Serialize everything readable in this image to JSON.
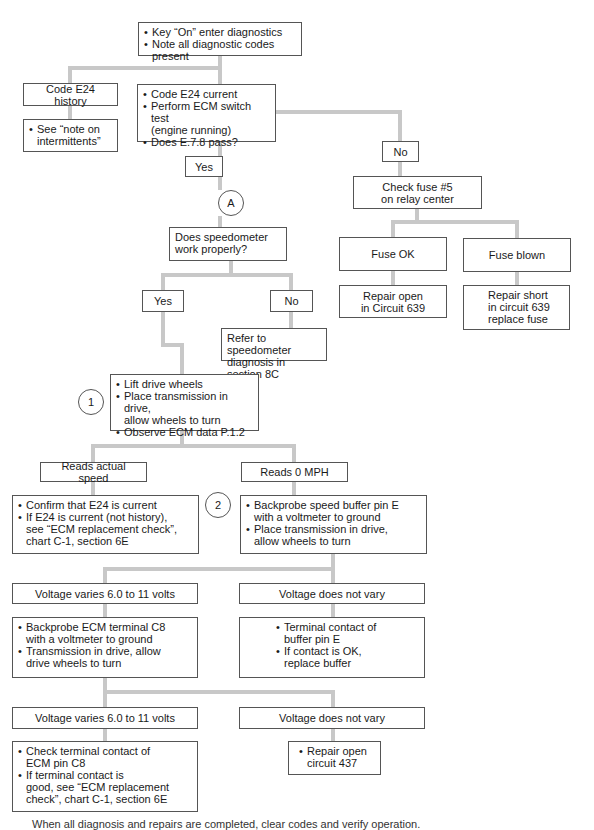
{
  "colors": {
    "connector": "#c8c8c8",
    "border": "#555555",
    "text": "#1a1a1a"
  },
  "nodes": {
    "start": {
      "bullets": [
        "Key “On” enter diagnostics",
        "Note all diagnostic codes present"
      ]
    },
    "code_history": {
      "label": "Code E24 history"
    },
    "see_note": {
      "bullets": [
        "See “note on\nintermittents”"
      ]
    },
    "code_current": {
      "bullets": [
        "Code E24 current",
        "Perform ECM switch test\n(engine running)",
        "Does E.7.8 pass?"
      ]
    },
    "yes_1": {
      "label": "Yes"
    },
    "no_1": {
      "label": "No"
    },
    "check_fuse": {
      "label": "Check fuse #5\non relay center"
    },
    "marker_a": {
      "label": "A"
    },
    "speedometer_q": {
      "label": "Does speedometer\nwork properly?"
    },
    "fuse_ok": {
      "label": "Fuse OK"
    },
    "fuse_blown": {
      "label": "Fuse blown"
    },
    "yes_2": {
      "label": "Yes"
    },
    "no_2": {
      "label": "No"
    },
    "repair_open_639": {
      "label": "Repair open\nin Circuit 639"
    },
    "repair_short_639": {
      "label": "Repair short\nin circuit 639\nreplace fuse"
    },
    "refer_speedometer": {
      "label": "Refer to speedometer\ndiagnosis in section 8C"
    },
    "marker_1": {
      "label": "1"
    },
    "lift_wheels": {
      "bullets": [
        "Lift drive wheels",
        "Place transmission in drive,\nallow wheels to turn",
        "Observe ECM data P.1.2"
      ]
    },
    "reads_actual": {
      "label": "Reads actual speed"
    },
    "reads_zero": {
      "label": "Reads 0 MPH"
    },
    "confirm_e24": {
      "bullets": [
        "Confirm that E24 is current",
        "If E24 is current (not history),\nsee “ECM replacement check”,\nchart C-1, section 6E"
      ]
    },
    "marker_2": {
      "label": "2"
    },
    "backprobe_buffer": {
      "bullets": [
        "Backprobe speed buffer pin E\nwith a voltmeter to ground",
        "Place transmission in drive,\nallow wheels to turn"
      ]
    },
    "voltage_varies_1": {
      "label": "Voltage varies 6.0 to 11 volts"
    },
    "voltage_not_vary_1": {
      "label": "Voltage does not vary"
    },
    "backprobe_ecm": {
      "bullets": [
        "Backprobe ECM terminal C8\nwith a voltmeter to ground",
        "Transmission in drive, allow\ndrive wheels to turn"
      ]
    },
    "terminal_buffer": {
      "bullets": [
        "Terminal contact of\nbuffer pin E",
        "If contact is OK,\nreplace buffer"
      ]
    },
    "voltage_varies_2": {
      "label": "Voltage varies 6.0 to 11 volts"
    },
    "voltage_not_vary_2": {
      "label": "Voltage does not vary"
    },
    "check_ecm_pin": {
      "bullets": [
        "Check terminal contact of\nECM pin C8",
        "If terminal contact is\ngood, see “ECM replacement\ncheck”, chart C-1, section 6E"
      ]
    },
    "repair_open_437": {
      "bullets": [
        "Repair open\ncircuit 437"
      ]
    }
  },
  "footer": {
    "text": "When all diagnosis and repairs are completed, clear codes and verify operation."
  }
}
